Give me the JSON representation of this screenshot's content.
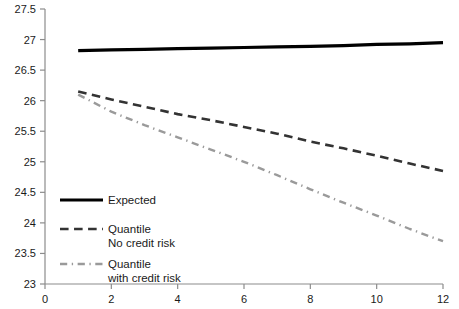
{
  "chart_data": {
    "type": "line",
    "title": "",
    "xlabel": "",
    "ylabel": "",
    "xlim": [
      0,
      12
    ],
    "ylim": [
      23,
      27.5
    ],
    "grid": false,
    "legend_position": "inside-lower-left",
    "xticks": [
      "0",
      "2",
      "4",
      "6",
      "8",
      "10",
      "12"
    ],
    "xtick_values": [
      0,
      2,
      4,
      6,
      8,
      10,
      12
    ],
    "yticks": [
      "23",
      "23.5",
      "24",
      "24.5",
      "25",
      "25.5",
      "26",
      "26.5",
      "27",
      "27.5"
    ],
    "ytick_values": [
      23,
      23.5,
      24,
      24.5,
      25,
      25.5,
      26,
      26.5,
      27,
      27.5
    ],
    "x": [
      1,
      2,
      3,
      4,
      5,
      6,
      7,
      8,
      9,
      10,
      11,
      12
    ],
    "series": [
      {
        "name": "Expected",
        "style": "solid",
        "color": "#000000",
        "width": 3.2,
        "values": [
          26.82,
          26.83,
          26.84,
          26.85,
          26.86,
          26.87,
          26.88,
          26.89,
          26.9,
          26.92,
          26.93,
          26.95
        ]
      },
      {
        "name": "Quantile No credit risk",
        "style": "dashed",
        "color": "#333333",
        "width": 2.6,
        "values": [
          26.15,
          26.02,
          25.9,
          25.78,
          25.68,
          25.57,
          25.46,
          25.33,
          25.22,
          25.1,
          24.97,
          24.85
        ]
      },
      {
        "name": "Quantile with credit risk",
        "style": "dashdot",
        "color": "#9a9a9a",
        "width": 2.4,
        "values": [
          26.1,
          25.82,
          25.6,
          25.4,
          25.2,
          25.0,
          24.78,
          24.55,
          24.33,
          24.12,
          23.9,
          23.7
        ]
      }
    ],
    "legend": [
      {
        "label_line1": "Expected",
        "label_line2": "",
        "style": "solid",
        "color": "#000000"
      },
      {
        "label_line1": "Quantile",
        "label_line2": "No credit risk",
        "style": "dashed",
        "color": "#333333"
      },
      {
        "label_line1": "Quantile",
        "label_line2": "with credit risk",
        "style": "dashdot",
        "color": "#9a9a9a"
      }
    ],
    "axis_color": "#8c8c8c"
  }
}
